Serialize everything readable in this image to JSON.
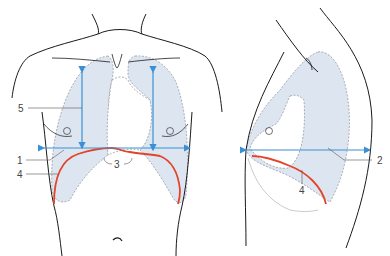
{
  "diagram": {
    "type": "anatomical",
    "colors": {
      "outline": "#1a1a1a",
      "lung_fill": "#dde6f0",
      "lung_border": "#8a9098",
      "arrow": "#3a8fd6",
      "diaphragm": "#e2442a",
      "leader": "#555555"
    },
    "views": [
      {
        "name": "front-view",
        "labels": [
          "1",
          "3",
          "4",
          "5"
        ]
      },
      {
        "name": "side-view",
        "labels": [
          "2",
          "4"
        ]
      }
    ],
    "labels": {
      "l1": "1",
      "l2": "2",
      "l3": "3",
      "l4_front": "4",
      "l4_side": "4",
      "l5": "5"
    }
  }
}
